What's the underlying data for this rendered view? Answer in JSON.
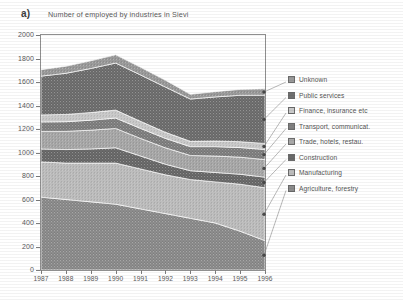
{
  "panel": {
    "label": "a)"
  },
  "legend": {
    "position": "right",
    "items": [
      {
        "label": "Unknown",
        "key": "unknown",
        "color": "#9a9a9a"
      },
      {
        "label": "Public services",
        "key": "public_services",
        "color": "#6f6f6f"
      },
      {
        "label": "Finance, insurance etc",
        "key": "finance",
        "color": "#c9c9c9"
      },
      {
        "label": "Transport, communicat.",
        "key": "transport",
        "color": "#808080"
      },
      {
        "label": "Trade, hotels, restau.",
        "key": "trade",
        "color": "#a8a8a8"
      },
      {
        "label": "Construction",
        "key": "construction",
        "color": "#6a6a6a"
      },
      {
        "label": "Manufacturing",
        "key": "manufacturing",
        "color": "#bdbdbd"
      },
      {
        "label": "Agriculture, forestry",
        "key": "agriculture",
        "color": "#8c8c8c"
      }
    ]
  },
  "chart_data": {
    "type": "area",
    "stacked": true,
    "title": "Number of employed by industries in Sievi",
    "xlabel": "",
    "ylabel": "",
    "xlim": [
      1987,
      1996
    ],
    "ylim": [
      0,
      2000
    ],
    "ytick_step": 200,
    "grid": false,
    "categories": [
      1987,
      1988,
      1989,
      1990,
      1991,
      1992,
      1993,
      1994,
      1995,
      1996
    ],
    "xticks": [
      "1987",
      "1988",
      "1989",
      "1990",
      "1991",
      "1992",
      "1993",
      "1994",
      "1995",
      "1996"
    ],
    "yticks": [
      "0",
      "200",
      "400",
      "600",
      "800",
      "1000",
      "1200",
      "1400",
      "1600",
      "1800",
      "2000"
    ],
    "series": [
      {
        "name": "Agriculture, forestry",
        "color": "#8c8c8c",
        "values": [
          620,
          600,
          580,
          560,
          520,
          480,
          440,
          400,
          330,
          250
        ]
      },
      {
        "name": "Manufacturing",
        "color": "#bdbdbd",
        "values": [
          300,
          310,
          330,
          350,
          340,
          330,
          330,
          350,
          400,
          450
        ]
      },
      {
        "name": "Construction",
        "color": "#6a6a6a",
        "values": [
          110,
          115,
          120,
          130,
          110,
          90,
          75,
          80,
          85,
          90
        ]
      },
      {
        "name": "Trade, hotels, restau.",
        "color": "#a8a8a8",
        "values": [
          150,
          155,
          160,
          165,
          150,
          140,
          130,
          140,
          145,
          150
        ]
      },
      {
        "name": "Transport, communicat.",
        "color": "#808080",
        "values": [
          80,
          82,
          85,
          88,
          85,
          80,
          75,
          80,
          82,
          85
        ]
      },
      {
        "name": "Finance, insurance etc",
        "color": "#c9c9c9",
        "values": [
          60,
          62,
          65,
          68,
          60,
          52,
          45,
          48,
          50,
          52
        ]
      },
      {
        "name": "Public services",
        "color": "#6f6f6f",
        "values": [
          330,
          350,
          375,
          400,
          395,
          385,
          360,
          375,
          395,
          410
        ]
      },
      {
        "name": "Unknown",
        "color": "#9a9a9a",
        "values": [
          55,
          60,
          65,
          70,
          65,
          58,
          40,
          45,
          50,
          55
        ]
      }
    ],
    "totals": [
      1705,
      1734,
      1780,
      1831,
      1725,
      1615,
      1495,
      1518,
      1537,
      1542
    ]
  }
}
